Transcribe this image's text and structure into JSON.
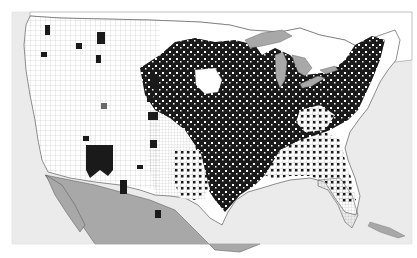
{
  "map": {
    "type": "choropleth",
    "region": "United States counties",
    "colors": {
      "background": "#ffffff",
      "water": "#e8e8e8",
      "land_inactive": "#ffffff",
      "county_highlighted": "#1a1a1a",
      "foreign_land": "#a8a8a8",
      "great_lakes": "#a8a8a8",
      "border": "#555555"
    },
    "legend": [],
    "title": ""
  }
}
